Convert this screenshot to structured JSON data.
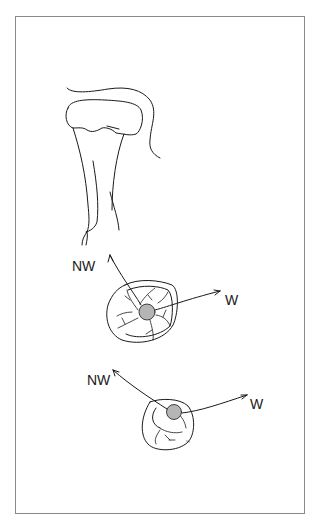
{
  "figure": {
    "type": "line-illustration",
    "colors": {
      "line": "#1a1a1a",
      "frame": "#8a8a8a",
      "background": "#ffffff",
      "stipple": "#9a9a9a"
    }
  },
  "views": [
    {
      "name": "side-view",
      "labels": []
    },
    {
      "name": "occlusal-view-upper",
      "labels": {
        "left": "NW",
        "right": "W"
      }
    },
    {
      "name": "occlusal-view-lower",
      "labels": {
        "left": "NW",
        "right": "W"
      }
    }
  ]
}
